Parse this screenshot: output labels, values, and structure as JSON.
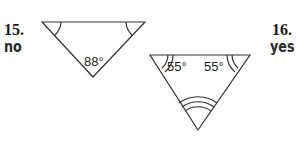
{
  "problems": [
    {
      "number": "15.",
      "answer": "no",
      "triangle": {
        "angles": [
          {
            "vertex": "top-left",
            "label": "",
            "arcs": 1
          },
          {
            "vertex": "top-right",
            "label": "",
            "arcs": 1
          },
          {
            "vertex": "bottom",
            "label": "88°",
            "arcs": 0
          }
        ]
      }
    },
    {
      "number": "16.",
      "answer": "yes",
      "triangle": {
        "angles": [
          {
            "vertex": "top-left",
            "label": "55°",
            "arcs": 2
          },
          {
            "vertex": "top-right",
            "label": "55°",
            "arcs": 2
          },
          {
            "vertex": "bottom",
            "label": "",
            "arcs": 3
          }
        ]
      }
    }
  ]
}
